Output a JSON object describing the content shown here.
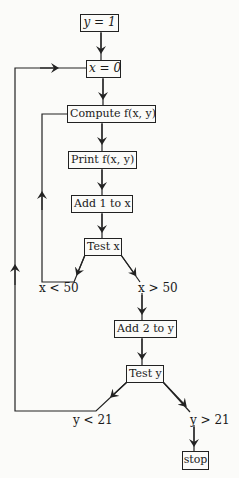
{
  "diagram": {
    "type": "flowchart",
    "nodes": [
      {
        "id": "init_y",
        "label": "y = 1"
      },
      {
        "id": "init_x",
        "label": "x = 0"
      },
      {
        "id": "compute",
        "label": "Compute f(x, y)"
      },
      {
        "id": "print",
        "label": "Print f(x, y)"
      },
      {
        "id": "add_x",
        "label": "Add 1 to x"
      },
      {
        "id": "test_x",
        "label": "Test x"
      },
      {
        "id": "add_y",
        "label": "Add 2 to y"
      },
      {
        "id": "test_y",
        "label": "Test y"
      },
      {
        "id": "stop",
        "label": "stop"
      }
    ],
    "edge_labels": {
      "x_lt": "x < 50",
      "x_gt": "x > 50",
      "y_lt": "y < 21",
      "y_gt": "y > 21"
    },
    "edges": [
      {
        "from": "init_y",
        "to": "init_x"
      },
      {
        "from": "init_x",
        "to": "compute"
      },
      {
        "from": "compute",
        "to": "print"
      },
      {
        "from": "print",
        "to": "add_x"
      },
      {
        "from": "add_x",
        "to": "test_x"
      },
      {
        "from": "test_x",
        "to": "compute",
        "label": "x < 50"
      },
      {
        "from": "test_x",
        "to": "add_y",
        "label": "x > 50"
      },
      {
        "from": "add_y",
        "to": "test_y"
      },
      {
        "from": "test_y",
        "to": "init_x",
        "label": "y < 21"
      },
      {
        "from": "test_y",
        "to": "stop",
        "label": "y > 21"
      }
    ],
    "line_color": "#222222"
  }
}
